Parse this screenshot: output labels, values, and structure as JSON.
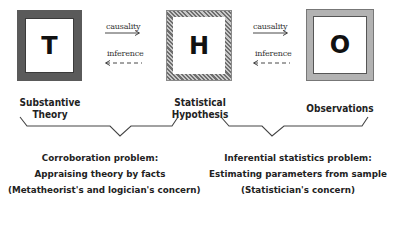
{
  "diagram": {
    "boxes": [
      {
        "id": "T",
        "letter": "T",
        "label_line1": "Substantive",
        "label_line2": "Theory",
        "border_style": "solid dark gray"
      },
      {
        "id": "H",
        "letter": "H",
        "label_line1": "Statistical",
        "label_line2": "Hypothesis",
        "border_style": "hatched gray"
      },
      {
        "id": "O",
        "letter": "O",
        "label_line1": "Observations",
        "label_line2": "",
        "border_style": "stippled light gray"
      }
    ],
    "arrows": [
      {
        "between": "T-H",
        "forward_label": "causality",
        "backward_label": "inference"
      },
      {
        "between": "H-O",
        "forward_label": "causality",
        "backward_label": "inference"
      }
    ],
    "captions": [
      {
        "spans": "T-H",
        "line1": "Corroboration problem:",
        "line2": "Appraising theory by facts",
        "line3": "(Metatheorist's and logician's concern)"
      },
      {
        "spans": "H-O",
        "line1": "Inferential statistics problem:",
        "line2": "Estimating parameters from sample",
        "line3": "(Statistician's concern)"
      }
    ],
    "colors": {
      "box_t_border": "#5a5a5a",
      "box_h_border": "#8a8a8a",
      "box_o_border": "#d0d0d0",
      "text": "#222222",
      "lines": "#444444"
    }
  }
}
